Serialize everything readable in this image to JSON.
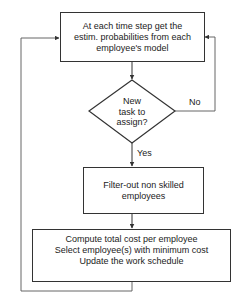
{
  "flowchart": {
    "nodes": {
      "estimate": {
        "type": "process",
        "text": "At each time step get the estim. probabilities from each employee's model",
        "lines": [
          "At each time step get the",
          "estim. probabilities from each",
          "employee's model"
        ]
      },
      "decision": {
        "type": "decision",
        "lines": [
          "New",
          "task to",
          "assign?"
        ]
      },
      "filter": {
        "type": "process",
        "lines": [
          "Filter-out non skilled",
          "employees"
        ]
      },
      "compute": {
        "type": "process",
        "lines": [
          "Compute total cost per employee",
          "Select employee(s) with minimum cost",
          "Update the work schedule"
        ]
      }
    },
    "edges": {
      "yes_label": "Yes",
      "no_label": "No"
    },
    "colors": {
      "line": "#333333",
      "text": "#222222",
      "background": "#ffffff"
    }
  }
}
